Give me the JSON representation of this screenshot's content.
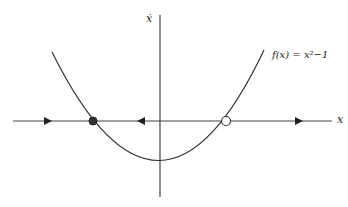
{
  "diagram": {
    "type": "phase-line",
    "function_label": "f(x) = x²−1",
    "x_axis_label": "x",
    "y_axis_label": "ẋ",
    "fixed_points": [
      {
        "x": -1,
        "stability": "stable",
        "style": "filled"
      },
      {
        "x": 1,
        "stability": "unstable",
        "style": "open"
      }
    ],
    "flow_arrows": [
      {
        "region": "x < -1",
        "direction": "right"
      },
      {
        "region": "-1 < x < 1",
        "direction": "left"
      },
      {
        "region": "x > 1",
        "direction": "right"
      }
    ],
    "colors": {
      "line": "#333333",
      "background": "#ffffff"
    }
  }
}
